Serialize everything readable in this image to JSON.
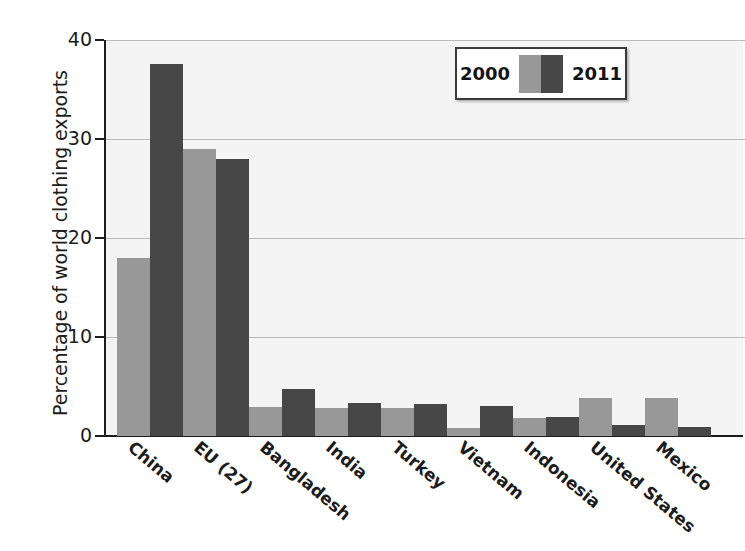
{
  "chart_data": {
    "type": "bar",
    "title": "",
    "xlabel": "",
    "ylabel": "Percentage of world clothing exports",
    "ylim": [
      0,
      40
    ],
    "yticks": [
      0,
      10,
      20,
      30,
      40
    ],
    "ytick_labels": [
      "0",
      "10",
      "20",
      "30",
      "40"
    ],
    "grid": true,
    "grid_axis": "y",
    "legend_position": "top-right",
    "categories": [
      "China",
      "EU (27)",
      "Bangladesh",
      "India",
      "Turkey",
      "Vietnam",
      "Indonesia",
      "United States",
      "Mexico"
    ],
    "series": [
      {
        "name": "2000",
        "color": "#989898",
        "values": [
          18.0,
          29.0,
          2.9,
          2.8,
          2.8,
          0.8,
          1.8,
          3.8,
          3.8
        ]
      },
      {
        "name": "2011",
        "color": "#474747",
        "values": [
          37.6,
          28.0,
          4.7,
          3.3,
          3.2,
          3.0,
          1.9,
          1.1,
          0.9
        ]
      }
    ]
  },
  "legend": {
    "left_label": "2000",
    "right_label": "2011",
    "swatch_left_color": "#989898",
    "swatch_right_color": "#474747"
  },
  "colors": {
    "series_2000": "#989898",
    "series_2011": "#474747",
    "plot_background": "#f4f4f4",
    "axis": "#1c1c1c",
    "gridline": "#b9b9b9",
    "page_background": "#ffffff"
  }
}
